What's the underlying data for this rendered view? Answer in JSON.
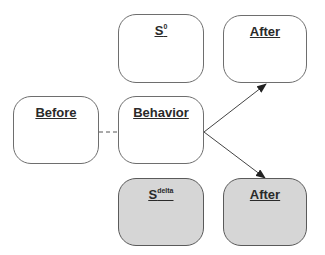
{
  "diagram": {
    "type": "behavior-contingency",
    "nodes": {
      "s_zero": {
        "label": "S",
        "superscript": "0",
        "fill": "#ffffff"
      },
      "after_top": {
        "label": "After",
        "fill": "#ffffff"
      },
      "before": {
        "label": "Before",
        "fill": "#ffffff"
      },
      "behavior": {
        "label": "Behavior",
        "fill": "#ffffff"
      },
      "s_delta": {
        "label": "S",
        "superscript": "delta",
        "fill": "#d6d6d6"
      },
      "after_bottom": {
        "label": "After",
        "fill": "#d6d6d6"
      }
    },
    "edges": [
      {
        "from": "before",
        "to": "behavior",
        "style": "dashed"
      },
      {
        "from": "behavior",
        "to": "after_top",
        "style": "arrow"
      },
      {
        "from": "behavior",
        "to": "after_bottom",
        "style": "arrow"
      }
    ]
  }
}
